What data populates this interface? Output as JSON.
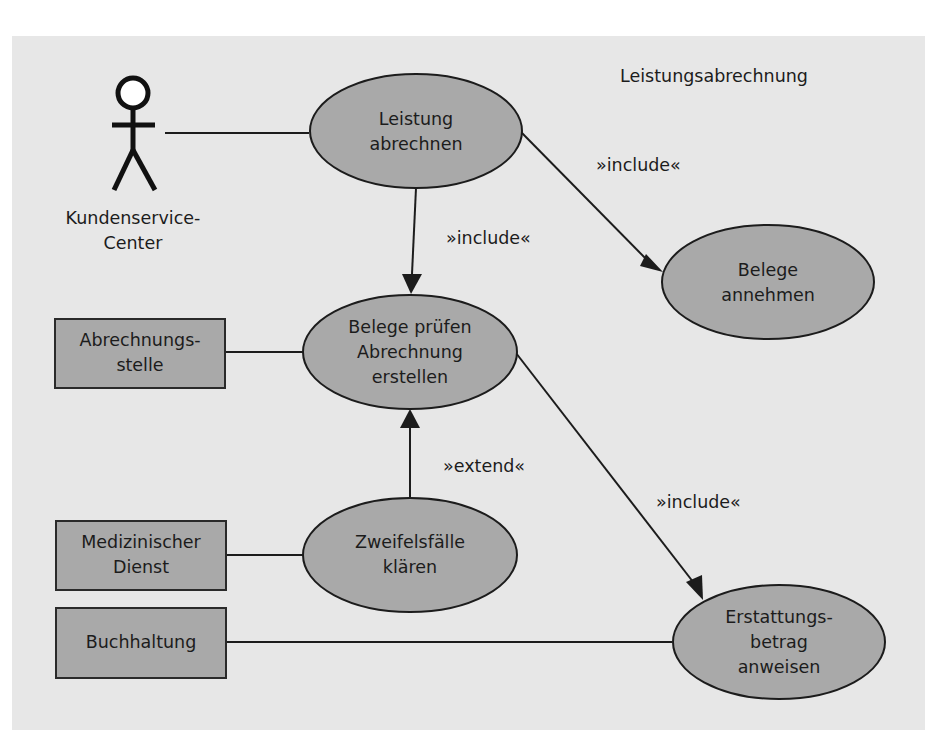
{
  "diagram": {
    "type": "uml-use-case",
    "system_boundary_title": "Leistungsabrechnung",
    "colors": {
      "panel_background": "#e7e7e7",
      "shape_fill": "#a9a9a9",
      "stroke": "#1c1c1c",
      "text": "#1c1c1c"
    },
    "actors": [
      {
        "id": "kundenservice",
        "kind": "stick-figure",
        "label_lines": [
          "Kundenservice-",
          "Center"
        ]
      },
      {
        "id": "abrechnungsstelle",
        "kind": "box",
        "label_lines": [
          "Abrechnungs-",
          "stelle"
        ]
      },
      {
        "id": "medizinischer-dienst",
        "kind": "box",
        "label_lines": [
          "Medizinischer",
          "Dienst"
        ]
      },
      {
        "id": "buchhaltung",
        "kind": "box",
        "label_lines": [
          "Buchhaltung"
        ]
      }
    ],
    "use_cases": [
      {
        "id": "leistung-abrechnen",
        "label_lines": [
          "Leistung",
          "abrechnen"
        ]
      },
      {
        "id": "belege-pruefen",
        "label_lines": [
          "Belege prüfen",
          "Abrechnung",
          "erstellen"
        ]
      },
      {
        "id": "belege-annehmen",
        "label_lines": [
          "Belege",
          "annehmen"
        ]
      },
      {
        "id": "zweifelsfaelle-klaeren",
        "label_lines": [
          "Zweifelsfälle",
          "klären"
        ]
      },
      {
        "id": "erstattungsbetrag-anweisen",
        "label_lines": [
          "Erstattungs-",
          "betrag",
          "anweisen"
        ]
      }
    ],
    "relations": [
      {
        "from": "kundenservice",
        "to": "leistung-abrechnen",
        "type": "association",
        "label": ""
      },
      {
        "from": "abrechnungsstelle",
        "to": "belege-pruefen",
        "type": "association",
        "label": ""
      },
      {
        "from": "medizinischer-dienst",
        "to": "zweifelsfaelle-klaeren",
        "type": "association",
        "label": ""
      },
      {
        "from": "buchhaltung",
        "to": "erstattungsbetrag-anweisen",
        "type": "association",
        "label": ""
      },
      {
        "from": "leistung-abrechnen",
        "to": "belege-pruefen",
        "type": "include",
        "label": "»include«"
      },
      {
        "from": "leistung-abrechnen",
        "to": "belege-annehmen",
        "type": "include",
        "label": "»include«"
      },
      {
        "from": "belege-pruefen",
        "to": "erstattungsbetrag-anweisen",
        "type": "include",
        "label": "»include«"
      },
      {
        "from": "zweifelsfaelle-klaeren",
        "to": "belege-pruefen",
        "type": "extend",
        "label": "»extend«"
      }
    ]
  }
}
